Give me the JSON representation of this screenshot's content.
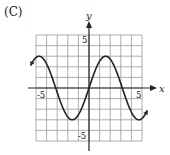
{
  "panel_label": "(C)",
  "chart_data": {
    "type": "line",
    "title": "",
    "xlabel": "x",
    "ylabel": "y",
    "xlim": [
      -5,
      5
    ],
    "ylim": [
      -5,
      5
    ],
    "grid": true,
    "x_tick_labels": [
      "-5",
      "5"
    ],
    "y_tick_labels": [
      "5",
      "-5"
    ],
    "series": [
      {
        "name": "y = 3 sin(x)",
        "function": "3*sin(x)",
        "amplitude": 3,
        "period": 6.283,
        "x_start": -5.5,
        "x_end": 5.5,
        "key_points": [
          [
            -4.71,
            3
          ],
          [
            -3.14,
            0
          ],
          [
            -1.57,
            -3
          ],
          [
            0,
            0
          ],
          [
            1.57,
            3
          ],
          [
            3.14,
            0
          ],
          [
            4.71,
            -3
          ]
        ]
      }
    ],
    "curve_color": "#222222",
    "grid_color": "#999999"
  }
}
